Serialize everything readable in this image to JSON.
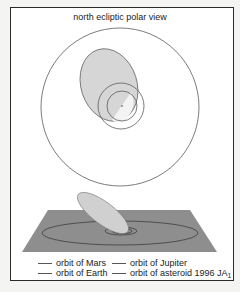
{
  "figure": {
    "title": "north ecliptic polar view",
    "colors": {
      "orbit_stroke": "#5a5a5a",
      "asteroid_fill": "#d6d6d6",
      "plane_fill": "#8e8e8e",
      "frame": "#2a2a2a",
      "background": "#ffffff"
    }
  },
  "legend": {
    "items": [
      {
        "label": "orbit of Mars"
      },
      {
        "label": "orbit of Jupiter"
      },
      {
        "label": "orbit of Earth"
      },
      {
        "label": "orbit of asteroid 1996 JA",
        "subscript": "1"
      }
    ]
  }
}
